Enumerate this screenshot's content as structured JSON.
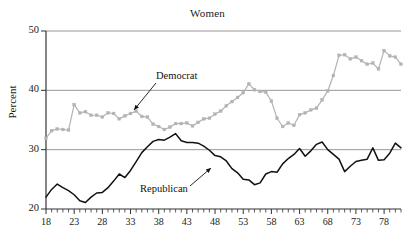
{
  "chart_data": {
    "type": "line",
    "title": "Women",
    "xlabel": "",
    "ylabel": "Percent",
    "xlim": [
      18,
      81
    ],
    "ylim": [
      20,
      50
    ],
    "grid": "horizontal",
    "gridlines": [
      30,
      40,
      50
    ],
    "legend_position": "inline-annotations",
    "y_ticks": [
      20,
      30,
      40,
      50
    ],
    "y_tick_labels": [
      "20",
      "30",
      "40",
      "50"
    ],
    "x_ticks": [
      18,
      23,
      28,
      33,
      38,
      43,
      48,
      53,
      58,
      63,
      68,
      73,
      78
    ],
    "x_tick_labels": [
      "18",
      "23",
      "28",
      "33",
      "38",
      "43",
      "48",
      "53",
      "58",
      "63",
      "68",
      "73",
      "78"
    ],
    "x_minor_tick_step": 1,
    "x": [
      18,
      19,
      20,
      21,
      22,
      23,
      24,
      25,
      26,
      27,
      28,
      29,
      30,
      31,
      32,
      33,
      34,
      35,
      36,
      37,
      38,
      39,
      40,
      41,
      42,
      43,
      44,
      45,
      46,
      47,
      48,
      49,
      50,
      51,
      52,
      53,
      54,
      55,
      56,
      57,
      58,
      59,
      60,
      61,
      62,
      63,
      64,
      65,
      66,
      67,
      68,
      69,
      70,
      71,
      72,
      73,
      74,
      75,
      76,
      77,
      78,
      79,
      80,
      81
    ],
    "series": [
      {
        "name": "Democrat",
        "color": "#b3b3b3",
        "marker": "square",
        "values": [
          31.9,
          33.2,
          33.5,
          33.4,
          33.3,
          37.6,
          36.2,
          36.4,
          35.8,
          35.8,
          35.5,
          36.2,
          36.1,
          35.2,
          35.7,
          36.1,
          36.5,
          35.6,
          35.5,
          34.3,
          33.9,
          33.4,
          33.8,
          34.4,
          34.4,
          34.5,
          34.0,
          34.6,
          35.2,
          35.3,
          36.0,
          36.5,
          37.4,
          38.1,
          38.8,
          39.6,
          41.1,
          40.1,
          39.8,
          39.7,
          38.2,
          35.3,
          33.9,
          34.5,
          34.1,
          35.9,
          36.2,
          36.7,
          37.0,
          38.4,
          39.9,
          42.5,
          45.9,
          46.0,
          45.3,
          45.6,
          45.0,
          44.4,
          44.6,
          43.6,
          46.7,
          45.8,
          45.6,
          44.4
        ]
      },
      {
        "name": "Republican",
        "color": "#111111",
        "marker": "none",
        "values": [
          22.0,
          23.3,
          24.2,
          23.6,
          23.1,
          22.4,
          21.4,
          21.1,
          22.0,
          22.7,
          22.8,
          23.6,
          24.7,
          25.9,
          25.3,
          26.5,
          28.0,
          29.5,
          30.5,
          31.4,
          31.7,
          31.6,
          32.1,
          32.7,
          31.5,
          31.2,
          31.2,
          31.1,
          30.6,
          29.9,
          29.0,
          28.8,
          28.1,
          26.8,
          26.1,
          25.0,
          24.9,
          24.1,
          24.4,
          25.9,
          26.3,
          26.2,
          27.6,
          28.5,
          29.2,
          30.2,
          28.9,
          29.8,
          30.9,
          31.3,
          30.0,
          29.2,
          28.4,
          26.3,
          27.2,
          28.0,
          28.2,
          28.4,
          30.3,
          28.2,
          28.3,
          29.4,
          31.1,
          30.3
        ]
      }
    ],
    "annotations": [
      {
        "text": "Democrat",
        "series": "Democrat"
      },
      {
        "text": "Republican",
        "series": "Republican"
      }
    ]
  }
}
